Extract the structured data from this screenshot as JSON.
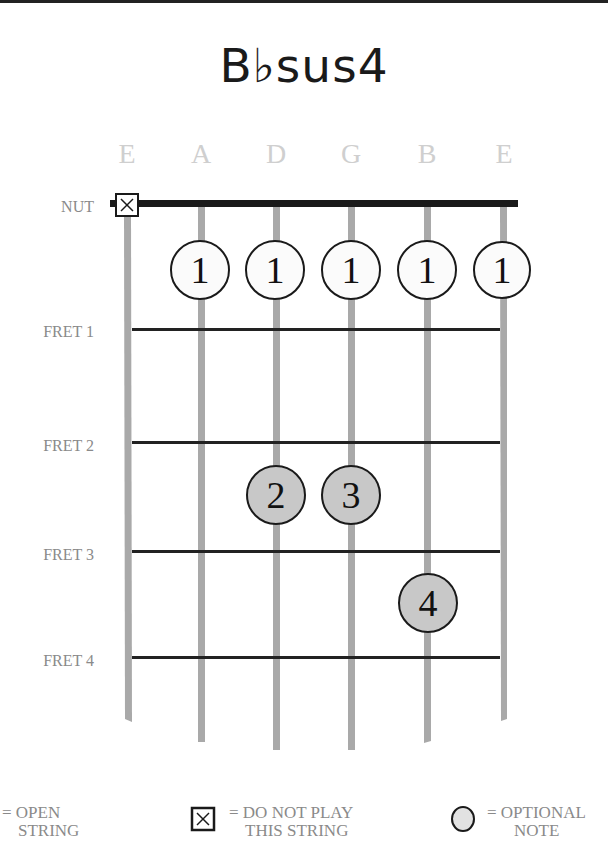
{
  "chord": {
    "title": "B♭sus4"
  },
  "strings": [
    {
      "label": "E",
      "x": 127,
      "bottom": 722
    },
    {
      "label": "A",
      "x": 201,
      "bottom": 742
    },
    {
      "label": "D",
      "x": 276,
      "bottom": 750
    },
    {
      "label": "G",
      "x": 351,
      "bottom": 750
    },
    {
      "label": "B",
      "x": 427,
      "bottom": 742
    },
    {
      "label": "E",
      "x": 504,
      "bottom": 720
    }
  ],
  "rows": {
    "nut": {
      "label": "NUT",
      "y": 203
    },
    "frets": [
      {
        "label": "FRET 1",
        "y": 330
      },
      {
        "label": "FRET 2",
        "y": 443
      },
      {
        "label": "FRET 3",
        "y": 552
      },
      {
        "label": "FRET 4",
        "y": 658
      }
    ]
  },
  "muted_strings": [
    0
  ],
  "fingers": [
    {
      "string": 1,
      "finger": "1",
      "y": 270,
      "optional": false
    },
    {
      "string": 2,
      "finger": "1",
      "y": 270,
      "optional": false
    },
    {
      "string": 3,
      "finger": "1",
      "y": 270,
      "optional": false
    },
    {
      "string": 4,
      "finger": "1",
      "y": 270,
      "optional": false
    },
    {
      "string": 5,
      "finger": "1",
      "y": 270,
      "optional": false
    },
    {
      "string": 2,
      "finger": "2",
      "y": 495,
      "optional": true
    },
    {
      "string": 3,
      "finger": "3",
      "y": 495,
      "optional": true
    },
    {
      "string": 4,
      "finger": "4",
      "y": 603,
      "optional": true
    }
  ],
  "legend": {
    "open": {
      "line1": "= OPEN",
      "line2": "STRING"
    },
    "muted": {
      "line1": "= DO NOT PLAY",
      "line2": "THIS STRING"
    },
    "optional": {
      "line1": "= OPTIONAL",
      "line2": "NOTE"
    }
  },
  "colors": {
    "string": "#a9a9a9",
    "fret": "#222222",
    "nut": "#1a1a1a",
    "finger_fill": "#fbfbfb",
    "optional_fill": "#c8c8c8",
    "label": "#8a8a8a",
    "string_label": "#cfcfcf"
  }
}
